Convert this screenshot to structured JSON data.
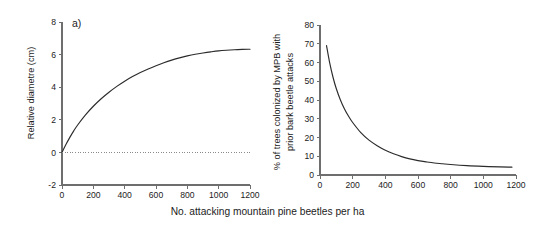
{
  "figure": {
    "shared_xlabel": "No. attacking mountain pine beetles per ha"
  },
  "chart_data": [
    {
      "type": "line",
      "panel_tag": "a)",
      "title": "",
      "xlabel": "No. attacking mountain pine beetles per ha",
      "ylabel": "Relative diametre (cm)",
      "xlim": [
        0,
        1200
      ],
      "ylim": [
        -2,
        8
      ],
      "xticks": [
        0,
        200,
        400,
        600,
        800,
        1000,
        1200
      ],
      "yticks": [
        -2,
        0,
        2,
        4,
        6,
        8
      ],
      "grid": false,
      "legend": "none",
      "series": [
        {
          "name": "Relative diametre",
          "style": "solid",
          "color": "#2b2b2b",
          "x": [
            0,
            25,
            50,
            75,
            100,
            150,
            200,
            250,
            300,
            350,
            400,
            450,
            500,
            550,
            600,
            650,
            700,
            750,
            800,
            850,
            900,
            950,
            1000,
            1050,
            1100,
            1150,
            1200
          ],
          "y": [
            0.0,
            0.48,
            0.92,
            1.32,
            1.68,
            2.3,
            2.83,
            3.29,
            3.69,
            4.05,
            4.37,
            4.65,
            4.9,
            5.12,
            5.32,
            5.5,
            5.66,
            5.8,
            5.92,
            6.02,
            6.1,
            6.17,
            6.23,
            6.27,
            6.3,
            6.32,
            6.33
          ]
        },
        {
          "name": "zero reference",
          "style": "dotted",
          "color": "#8a8a8a",
          "x": [
            0,
            1200
          ],
          "y": [
            0,
            0
          ]
        }
      ]
    },
    {
      "type": "line",
      "panel_tag": "b)",
      "title": "",
      "xlabel": "No. attacking mountain pine beetles per ha",
      "ylabel": "% of trees colonized by MPB with prior bark beetle attacks",
      "ylabel_line1": "% of trees colonized by MPB with",
      "ylabel_line2": "prior bark beetle attacks",
      "xlim": [
        0,
        1200
      ],
      "ylim": [
        0,
        80
      ],
      "xticks": [
        0,
        200,
        400,
        600,
        800,
        1000,
        1200
      ],
      "yticks": [
        0,
        10,
        20,
        30,
        40,
        50,
        60,
        70,
        80
      ],
      "grid": false,
      "legend": "none",
      "series": [
        {
          "name": "% trees colonized with prior attacks",
          "style": "solid",
          "color": "#2b2b2b",
          "x": [
            40,
            60,
            80,
            100,
            125,
            150,
            175,
            200,
            250,
            300,
            350,
            400,
            450,
            500,
            550,
            600,
            650,
            700,
            750,
            800,
            900,
            1000,
            1100,
            1175
          ],
          "y": [
            69.0,
            59.5,
            52.0,
            46.0,
            40.0,
            35.2,
            31.3,
            28.0,
            22.6,
            18.6,
            15.6,
            13.2,
            11.3,
            9.8,
            8.6,
            7.7,
            7.0,
            6.4,
            6.0,
            5.6,
            5.0,
            4.6,
            4.3,
            4.2
          ]
        }
      ]
    }
  ]
}
